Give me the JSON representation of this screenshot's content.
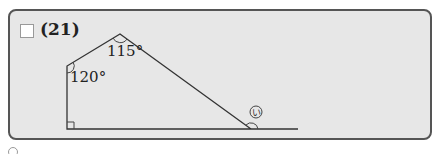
{
  "question": {
    "number_label": "(21)",
    "checkbox_checked": false
  },
  "figure": {
    "shape": "pentagon-like polygon with baseline extension",
    "vertices": {
      "bottom_left": [
        67,
        129
      ],
      "left": [
        67,
        66
      ],
      "top": [
        120,
        34
      ],
      "right": [
        251,
        129
      ]
    },
    "baseline_end": [
      298,
      129
    ],
    "angles": [
      {
        "label": "120°",
        "vertex": "left"
      },
      {
        "label": "115°",
        "vertex": "top"
      },
      {
        "label": "90°",
        "vertex": "bottom_left",
        "marker": "right-angle"
      }
    ],
    "unknown_angle": {
      "label": "い",
      "style": "circled",
      "vertex": "right",
      "position": "exterior"
    }
  },
  "colors": {
    "card_bg": "#e7e7e7",
    "card_border": "#555555",
    "line": "#333333"
  }
}
